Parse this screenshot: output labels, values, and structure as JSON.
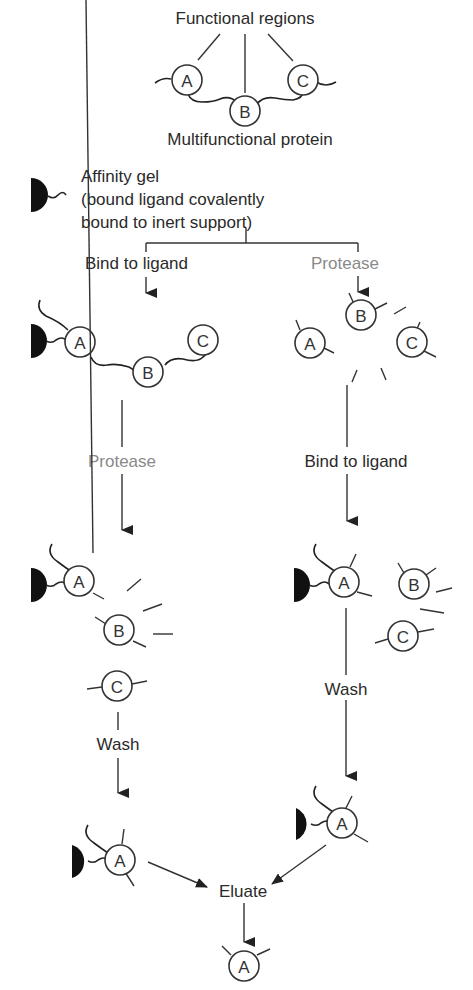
{
  "colors": {
    "ink": "#2a2a2a",
    "protease_label": "#8a8a8a",
    "gel": "#111111",
    "background": "#ffffff"
  },
  "header": {
    "functional_regions": "Functional regions",
    "multifunctional_protein": "Multifunctional protein"
  },
  "legend": {
    "affinity_gel_line1": "Affinity gel",
    "affinity_gel_line2": "(bound ligand covalently",
    "affinity_gel_line3": "bound to inert support)"
  },
  "nodes": {
    "a": "A",
    "b": "B",
    "c": "C"
  },
  "left_branch": {
    "step1": "Bind to ligand",
    "step2": "Protease",
    "step3": "Wash"
  },
  "right_branch": {
    "step1": "Protease",
    "step2": "Bind to ligand",
    "step3": "Wash"
  },
  "result": {
    "eluate": "Eluate"
  }
}
